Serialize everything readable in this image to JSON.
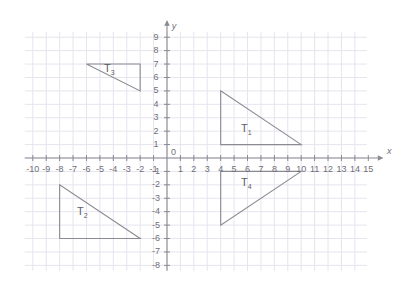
{
  "chart_data": {
    "type": "scatter",
    "title": "",
    "xlabel": "x",
    "ylabel": "y",
    "xlim": [
      -10.6,
      15.6
    ],
    "ylim": [
      -8.4,
      9.6
    ],
    "grid": true,
    "legend": "none",
    "x_ticks": [
      -10,
      -9,
      -8,
      -7,
      -6,
      -5,
      -4,
      -3,
      -2,
      -1,
      0,
      1,
      2,
      3,
      4,
      5,
      6,
      7,
      8,
      9,
      10,
      11,
      12,
      13,
      14,
      15
    ],
    "y_ticks": [
      9,
      8,
      7,
      6,
      5,
      4,
      3,
      2,
      1,
      -1,
      -2,
      -3,
      -4,
      -5,
      -6,
      -7,
      -8
    ],
    "origin_label": "0",
    "grid_extent": {
      "x_min": -10.6,
      "x_max": 14.9,
      "y_min": -8.4,
      "y_max": 9.4
    },
    "shapes": [
      {
        "name": "T1",
        "label": "T",
        "subscript": "1",
        "vertices": [
          [
            4,
            5
          ],
          [
            4,
            1
          ],
          [
            10,
            1
          ]
        ],
        "label_at": [
          5.9,
          2.1
        ],
        "stroke": "#8a8a93"
      },
      {
        "name": "T2",
        "label": "T",
        "subscript": "2",
        "vertices": [
          [
            -8,
            -2
          ],
          [
            -8,
            -6
          ],
          [
            -2,
            -6
          ]
        ],
        "label_at": [
          -6.3,
          -4.1
        ],
        "stroke": "#8a8a93"
      },
      {
        "name": "T3",
        "label": "T",
        "subscript": "3",
        "vertices": [
          [
            -6,
            7
          ],
          [
            -2,
            7
          ],
          [
            -2,
            5
          ]
        ],
        "label_at": [
          -4.3,
          6.6
        ],
        "stroke": "#8a8a93"
      },
      {
        "name": "T4",
        "label": "T",
        "subscript": "4",
        "vertices": [
          [
            4,
            -1
          ],
          [
            4,
            -5
          ],
          [
            10,
            -1
          ]
        ],
        "label_at": [
          5.9,
          -1.9
        ],
        "stroke": "#8a8a93"
      }
    ],
    "colors": {
      "grid": "#e6e4ee",
      "axis": "#8a8a93",
      "tick_text": "#6f6f78",
      "shape_stroke": "#8a8a93",
      "background": "#ffffff"
    }
  }
}
